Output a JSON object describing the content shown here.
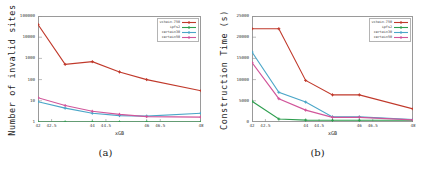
{
  "figure": {
    "panels": [
      {
        "caption": "(a)",
        "chart_data": {
          "type": "line",
          "title": "",
          "xlabel": "xGB",
          "ylabel": "Number of invalid sites",
          "yscale": "log",
          "ylim": [
            1,
            100000
          ],
          "yticks": [
            1,
            10,
            100,
            1000,
            10000,
            100000
          ],
          "ytick_labels": [
            "1",
            "10",
            "100",
            "1000",
            "10000",
            "100000"
          ],
          "xlim": [
            42,
            48
          ],
          "xticks": [
            42,
            42.5,
            44,
            44.5,
            46,
            46.5,
            48
          ],
          "xtick_labels": [
            "42",
            "42.5",
            "44",
            "44.5",
            "46",
            "46.5",
            "48"
          ],
          "grid": false,
          "legend_position": "top-right",
          "categories": [
            42,
            43,
            44,
            45,
            46,
            48
          ],
          "series": [
            {
              "name": "vchain-750",
              "color": "#c0392b",
              "values": [
                40000,
                520,
                700,
                230,
                100,
                30
              ]
            },
            {
              "name": "ipfs2",
              "color": "#2e9e4f",
              "values": [
                1,
                1,
                1,
                1,
                1,
                1
              ]
            },
            {
              "name": "certain30",
              "color": "#4aa6c8",
              "values": [
                9,
                4.5,
                2.6,
                2.0,
                1.9,
                2.6
              ]
            },
            {
              "name": "certain50",
              "color": "#d1559a",
              "values": [
                14,
                6.0,
                3.2,
                2.3,
                1.8,
                1.7
              ]
            }
          ]
        }
      },
      {
        "caption": "(b)",
        "chart_data": {
          "type": "line",
          "title": "",
          "xlabel": "xGB",
          "ylabel": "Construction Time (s)",
          "yscale": "linear",
          "ylim": [
            0,
            25000
          ],
          "yticks": [
            0,
            5000,
            10000,
            15000,
            20000,
            25000
          ],
          "ytick_labels": [
            "0",
            "5000",
            "10000",
            "15000",
            "20000",
            "25000"
          ],
          "xlim": [
            42,
            48
          ],
          "xticks": [
            42,
            42.5,
            44,
            44.5,
            46,
            46.5,
            48
          ],
          "xtick_labels": [
            "42",
            "42.5",
            "44",
            "44.5",
            "46",
            "46.5",
            "48"
          ],
          "grid": false,
          "legend_position": "top-right",
          "categories": [
            42,
            43,
            44,
            45,
            46,
            48
          ],
          "series": [
            {
              "name": "vchain-750",
              "color": "#c0392b",
              "values": [
                22000,
                22000,
                9800,
                6400,
                6400,
                3100
              ]
            },
            {
              "name": "ipfs2",
              "color": "#2e9e4f",
              "values": [
                4900,
                700,
                450,
                400,
                400,
                400
              ]
            },
            {
              "name": "certain30",
              "color": "#4aa6c8",
              "values": [
                16500,
                7000,
                4700,
                1200,
                1200,
                600
              ]
            },
            {
              "name": "certain50",
              "color": "#d1559a",
              "values": [
                14000,
                5500,
                2800,
                1100,
                1100,
                500
              ]
            }
          ]
        }
      }
    ]
  }
}
